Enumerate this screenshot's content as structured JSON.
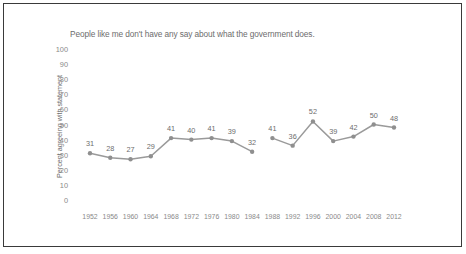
{
  "chart_data": {
    "type": "line",
    "title": "People like me don't have any say about what the government does.",
    "xlabel": "",
    "ylabel": "Percent agreeing with statement",
    "categories": [
      "1952",
      "1956",
      "1960",
      "1964",
      "1968",
      "1972",
      "1976",
      "1980",
      "1984",
      "1988",
      "1992",
      "1996",
      "2000",
      "2004",
      "2008",
      "2012"
    ],
    "values": [
      31,
      28,
      27,
      29,
      41,
      40,
      41,
      39,
      32,
      41,
      36,
      52,
      39,
      42,
      50,
      48
    ],
    "series": [
      {
        "name": "Percent agreeing with statement",
        "values": [
          31,
          28,
          27,
          29,
          41,
          40,
          41,
          39,
          32,
          41,
          36,
          52,
          39,
          42,
          50,
          48
        ]
      }
    ],
    "data_labels": [
      "31",
      "28",
      "27",
      "29",
      "41",
      "40",
      "41",
      "39",
      "32",
      "41",
      "36",
      "52",
      "39",
      "42",
      "50",
      "48"
    ],
    "ylim": [
      0,
      100
    ],
    "ytick_labels": [
      "100",
      "90",
      "80",
      "70",
      "60",
      "50",
      "40",
      "30",
      "20",
      "10",
      "0"
    ],
    "ytick_values": [
      100,
      90,
      80,
      70,
      60,
      50,
      40,
      30,
      20,
      10,
      0
    ],
    "grid": false,
    "legend": "none",
    "line_break_after_index": 8,
    "colors": {
      "line": "#9a9a9a",
      "marker": "#8f8f8f",
      "text": "#6d6d6d",
      "tick_text": "#8a8a8a",
      "frame": "#3a3a3a",
      "background": "#ffffff"
    }
  }
}
